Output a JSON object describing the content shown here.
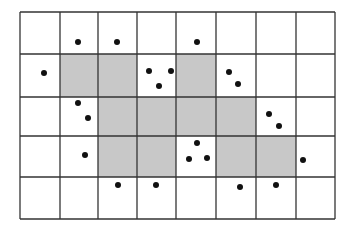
{
  "diagram": {
    "type": "grid-with-points",
    "rows": 5,
    "cols": 8,
    "col_lines": [
      20,
      60,
      98,
      137,
      176,
      216,
      256,
      296,
      335
    ],
    "row_lines": [
      12,
      54,
      97,
      136,
      177,
      219
    ],
    "colors": {
      "background": "#ffffff",
      "line": "#333333",
      "shade": "#c8c8c8",
      "dot": "#111111"
    },
    "shaded_cells": [
      [
        1,
        1
      ],
      [
        1,
        2
      ],
      [
        1,
        4
      ],
      [
        2,
        2
      ],
      [
        2,
        3
      ],
      [
        2,
        4
      ],
      [
        2,
        5
      ],
      [
        3,
        2
      ],
      [
        3,
        3
      ],
      [
        3,
        5
      ],
      [
        3,
        6
      ]
    ],
    "points": [
      [
        78,
        42
      ],
      [
        117,
        42
      ],
      [
        197,
        42
      ],
      [
        44,
        73
      ],
      [
        149,
        71
      ],
      [
        171,
        71
      ],
      [
        159,
        86
      ],
      [
        229,
        72
      ],
      [
        238,
        84
      ],
      [
        78,
        103
      ],
      [
        88,
        118
      ],
      [
        269,
        114
      ],
      [
        279,
        126
      ],
      [
        85,
        155
      ],
      [
        197,
        143
      ],
      [
        189,
        159
      ],
      [
        207,
        158
      ],
      [
        303,
        160
      ],
      [
        118,
        185
      ],
      [
        156,
        185
      ],
      [
        240,
        187
      ],
      [
        276,
        185
      ]
    ],
    "dot_radius": 3
  }
}
